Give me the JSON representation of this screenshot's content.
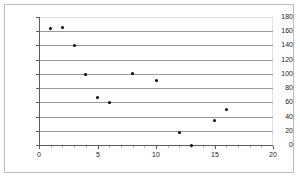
{
  "chart_data": {
    "type": "scatter",
    "title": "",
    "subtitle": "",
    "xlabel": "",
    "ylabel": "",
    "xlim": [
      0,
      20
    ],
    "ylim": [
      0,
      180
    ],
    "ytick_values": [
      0,
      20,
      40,
      60,
      80,
      100,
      120,
      140,
      160,
      180
    ],
    "ytick_labels": [
      "0",
      "20",
      "40",
      "60",
      "80",
      "100",
      "120",
      "140",
      "160",
      "180"
    ],
    "xtick_values": [
      0,
      5,
      10,
      15,
      20
    ],
    "xtick_labels": [
      "0",
      "5",
      "10",
      "15",
      "20"
    ],
    "xtick_minor_values": [
      1,
      2,
      3,
      4,
      6,
      7,
      8,
      9,
      11,
      12,
      13,
      14,
      16,
      17,
      18,
      19
    ],
    "grid": "horizontal",
    "legend": "none",
    "marker": "filled-circle",
    "marker_color": "#000000",
    "series": [
      {
        "name": "series-1",
        "points": [
          {
            "x": 1,
            "y": 164
          },
          {
            "x": 2,
            "y": 165
          },
          {
            "x": 3,
            "y": 140
          },
          {
            "x": 4,
            "y": 99
          },
          {
            "x": 5,
            "y": 67
          },
          {
            "x": 6,
            "y": 60
          },
          {
            "x": 8,
            "y": 100
          },
          {
            "x": 10,
            "y": 91
          },
          {
            "x": 12,
            "y": 18
          },
          {
            "x": 13,
            "y": 0
          },
          {
            "x": 15,
            "y": 35
          },
          {
            "x": 16,
            "y": 50
          }
        ]
      }
    ]
  }
}
